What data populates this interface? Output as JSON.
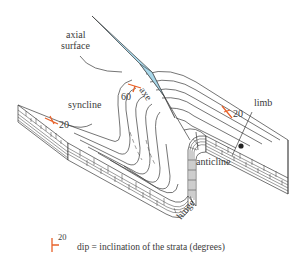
{
  "diagram": {
    "labels": {
      "axial_surface_line1": "axial",
      "axial_surface_line2": "surface",
      "syncline": "syncline",
      "anticline": "anticline",
      "limb": "limb",
      "hinge": "hinge",
      "axe": "axe",
      "dip_left": "20",
      "dip_right": "20",
      "dip_center": "60"
    },
    "legend": {
      "symbol_value": "20",
      "text": "dip = inclination of the strata (degrees)"
    },
    "colors": {
      "axial_surface_fill": "#a9d8ea",
      "dip_symbol": "#e8622a",
      "line": "#3a3a3a"
    }
  }
}
